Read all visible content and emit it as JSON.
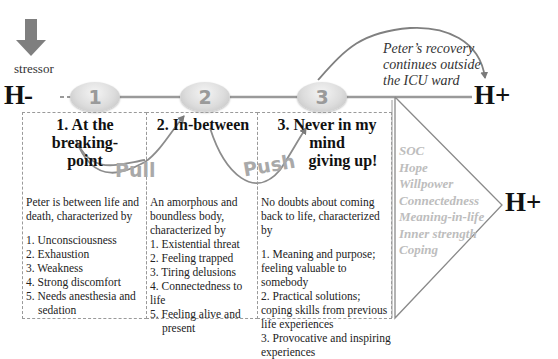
{
  "diagram": {
    "stressor": {
      "label": "stressor",
      "icon": "down-arrow-icon"
    },
    "axis": {
      "start_label": "H-",
      "end_label": "H+"
    },
    "nodes": [
      {
        "number": "1"
      },
      {
        "number": "2"
      },
      {
        "number": "3"
      }
    ],
    "recovery_note": {
      "lines": [
        "Peter’s recovery",
        "continues outside",
        "the ICU ward"
      ]
    },
    "forces": {
      "pull": "Pull",
      "push": "Push"
    },
    "phases": [
      {
        "title_lines": [
          "1. At the breaking-",
          "point"
        ],
        "intro": "Peter is between life and death, characterized by",
        "items": [
          "1. Unconsciousness",
          "2. Exhaustion",
          "3. Weakness",
          "4. Strong discomfort",
          "5. Needs anesthesia and",
          "sedation"
        ]
      },
      {
        "title_lines": [
          "2. In-between"
        ],
        "intro": "An amorphous and boundless body, characterized by",
        "items": [
          "1. Existential threat",
          "2. Feeling trapped",
          "3. Tiring delusions",
          "4. Connectedness to life",
          "5. Feeling alive and",
          "present"
        ]
      },
      {
        "title_lines": [
          "3. Never in my mind",
          "giving up!"
        ],
        "intro": "No doubts about coming back to life, characterized by",
        "items": [
          "1. Meaning and purpose; feeling valuable to somebody",
          "2. Practical solutions; coping skills from previous life experiences",
          "3. Provocative and inspiring experiences"
        ]
      }
    ],
    "resources": {
      "items": [
        "SOC",
        "Hope",
        "Willpower",
        "Connectedness",
        "Meaning-in-life",
        "Inner strength",
        "Coping"
      ],
      "end_label": "H+"
    },
    "colors": {
      "line": "#8c8c8c",
      "node": "#d6d6d6",
      "muted_text": "#bdbdbd",
      "arrow": "#808080"
    }
  }
}
